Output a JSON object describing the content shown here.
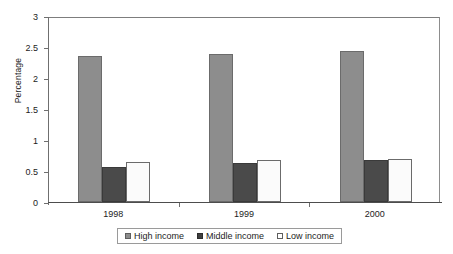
{
  "chart_data": {
    "type": "bar",
    "title": "",
    "xlabel": "",
    "ylabel": "Percentage",
    "categories": [
      "1998",
      "1999",
      "2000"
    ],
    "ylim": [
      0,
      3
    ],
    "yticks": [
      "0",
      "0.5",
      "1",
      "1.5",
      "2",
      "2.5",
      "3"
    ],
    "ytick_values": [
      0,
      0.5,
      1,
      1.5,
      2,
      2.5,
      3
    ],
    "grid": false,
    "legend_position": "bottom",
    "series": [
      {
        "name": "High income",
        "color": "#8d8d8d",
        "values": [
          2.35,
          2.39,
          2.44
        ]
      },
      {
        "name": "Middle income",
        "color": "#4a4a4a",
        "values": [
          0.56,
          0.63,
          0.67
        ]
      },
      {
        "name": "Low income",
        "color": "#ffffff",
        "values": [
          0.65,
          0.68,
          0.7
        ]
      }
    ]
  },
  "legend": {
    "items": [
      {
        "label": "High income"
      },
      {
        "label": "Middle income"
      },
      {
        "label": "Low income"
      }
    ]
  }
}
